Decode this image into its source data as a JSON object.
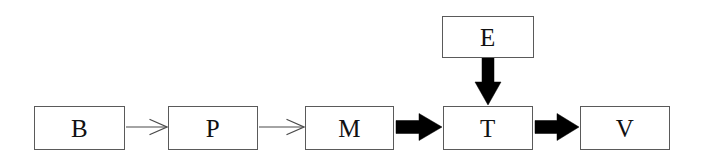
{
  "diagram": {
    "type": "flowchart",
    "orientation": "left-to-right",
    "canvas": {
      "width": 703,
      "height": 166,
      "background": "#ffffff"
    },
    "style": {
      "node_fill": "#ffffff",
      "node_stroke": "#5a5a5a",
      "node_stroke_width": 1,
      "label_color": "#111111",
      "thin_edge_color": "#4a4a4a",
      "thick_edge_color": "#000000"
    },
    "nodes": [
      {
        "id": "B",
        "label": "B",
        "x": 34,
        "y": 106,
        "width": 91,
        "height": 44
      },
      {
        "id": "P",
        "label": "P",
        "x": 168,
        "y": 106,
        "width": 90,
        "height": 44
      },
      {
        "id": "M",
        "label": "M",
        "x": 305,
        "y": 106,
        "width": 89,
        "height": 44
      },
      {
        "id": "T",
        "label": "T",
        "x": 443,
        "y": 106,
        "width": 90,
        "height": 44
      },
      {
        "id": "V",
        "label": "V",
        "x": 580,
        "y": 106,
        "width": 90,
        "height": 44
      },
      {
        "id": "E",
        "label": "E",
        "x": 442,
        "y": 16,
        "width": 92,
        "height": 42
      }
    ],
    "edges": [
      {
        "id": "B-to-P",
        "from": "B",
        "to": "P",
        "style": "thin-open-arrow",
        "direction": "right"
      },
      {
        "id": "P-to-M",
        "from": "P",
        "to": "M",
        "style": "thin-open-arrow",
        "direction": "right"
      },
      {
        "id": "M-to-T",
        "from": "M",
        "to": "T",
        "style": "thick-solid-arrow",
        "direction": "right"
      },
      {
        "id": "T-to-V",
        "from": "T",
        "to": "V",
        "style": "thick-solid-arrow",
        "direction": "right"
      },
      {
        "id": "E-to-T",
        "from": "E",
        "to": "T",
        "style": "thick-solid-arrow",
        "direction": "down"
      }
    ]
  }
}
